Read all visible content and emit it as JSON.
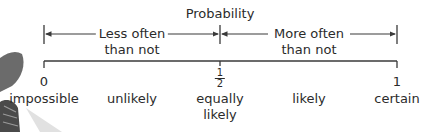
{
  "title": "Probability",
  "ranges": {
    "left": {
      "line1": "Less often",
      "line2": "than not"
    },
    "right": {
      "line1": "More often",
      "line2": "than not"
    }
  },
  "scale": {
    "points": [
      {
        "value": "0",
        "label": "impossible"
      },
      {
        "value": "",
        "label": "unlikely"
      },
      {
        "value_num": "1",
        "value_den": "2",
        "label_line1": "equally",
        "label_line2": "likely"
      },
      {
        "value": "",
        "label": "likely"
      },
      {
        "value": "1",
        "label": "certain"
      }
    ]
  },
  "colors": {
    "line": "#3a3a3a",
    "text": "#2b2b2b",
    "decoration": "#8a8a8a"
  }
}
